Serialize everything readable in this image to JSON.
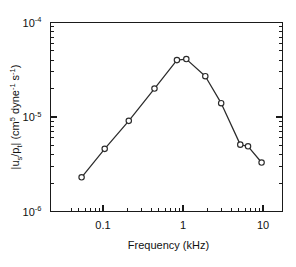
{
  "chart_data": {
    "type": "line",
    "title": "",
    "xlabel": "Frequency (kHz)",
    "ylabel": "|uₛ/pₜ|  (cm⁵ dyne⁻¹ s⁻¹)",
    "ylabel_parts": {
      "abs_open": "|u",
      "sub_s": "s",
      "slash": "/p",
      "sub_t": "t",
      "abs_close": "|  (cm",
      "sup_5": "5",
      "dyne": " dyne",
      "sup_m1a": "-1",
      "sec": " s",
      "sup_m1b": "-1",
      "paren_close": ")"
    },
    "xscale": "log",
    "yscale": "log",
    "xlim": [
      0.04,
      13.0
    ],
    "ylim": [
      1e-06,
      0.0001
    ],
    "grid": false,
    "legend": null,
    "x_tick_labels": [
      "0.1",
      "1",
      "10"
    ],
    "x_tick_values": [
      0.1,
      1,
      10
    ],
    "y_tick_labels": [
      "10-6",
      "10-5",
      "10-4"
    ],
    "y_tick_mantissa": "10",
    "y_tick_exponents": [
      "-6",
      "-5",
      "-4"
    ],
    "y_tick_values": [
      1e-06,
      1e-05,
      0.0001
    ],
    "marker": "open-circle",
    "series": [
      {
        "name": "transfer-magnitude",
        "x": [
          0.054,
          0.105,
          0.21,
          0.44,
          0.84,
          1.1,
          1.9,
          3.0,
          5.2,
          6.5,
          9.6
        ],
        "y": [
          2.3e-06,
          4.6e-06,
          9.1e-06,
          2e-05,
          4e-05,
          4.1e-05,
          2.7e-05,
          1.4e-05,
          5.1e-06,
          4.9e-06,
          3.3e-06
        ]
      }
    ],
    "colors": {
      "axis": "#1a1a1a",
      "line": "#2b2b2b",
      "marker_fill": "#ffffff",
      "background": "#ffffff"
    }
  }
}
